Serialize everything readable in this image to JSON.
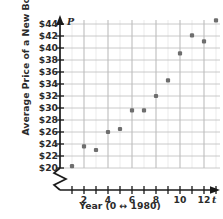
{
  "chart_data": {
    "type": "scatter",
    "title": "",
    "xlabel": "Year (0 ↔ 1980)",
    "ylabel": "Average Price of a New Book",
    "x_axis_variable": "t",
    "y_axis_variable": "P",
    "x": [
      1,
      2,
      3,
      4,
      5,
      6,
      7,
      8,
      9,
      10,
      11,
      12,
      13
    ],
    "values": [
      20.3,
      23.6,
      23.0,
      26.0,
      26.5,
      29.6,
      29.6,
      32.0,
      34.6,
      39.1,
      42.1,
      41.1,
      44.6
    ],
    "xlim": [
      0,
      13.6
    ],
    "ylim": [
      19.4,
      45.2
    ],
    "xticks": [
      1,
      2,
      3,
      4,
      5,
      6,
      7,
      8,
      9,
      10,
      11,
      12,
      13
    ],
    "xtick_labels": [
      "",
      "2",
      "",
      "4",
      "",
      "6",
      "",
      "8",
      "",
      "10",
      "",
      "12",
      ""
    ],
    "yticks": [
      20,
      22,
      24,
      26,
      28,
      30,
      32,
      34,
      36,
      38,
      40,
      42,
      44
    ],
    "ytick_labels": [
      "$20",
      "$22",
      "$24",
      "$26",
      "$28",
      "$30",
      "$32",
      "$34",
      "$36",
      "$38",
      "$40",
      "$42",
      "$44"
    ],
    "grid": true,
    "grid_color": "#c9c9c9",
    "minor_grid": true,
    "axis_break_y": true,
    "legend": null,
    "marker_color": "#6e6e6e",
    "axis_color": "#1a1a1a"
  }
}
